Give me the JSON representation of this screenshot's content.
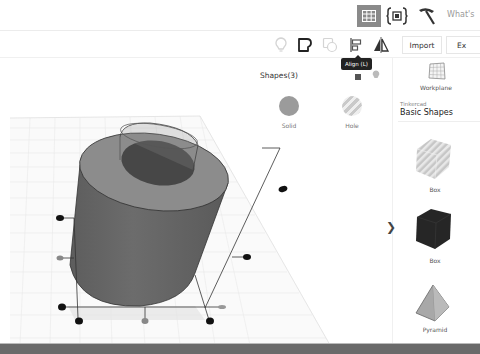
{
  "header": {
    "view_toggle_icon": "grid-icon",
    "codeblocks_icon": "codeblocks-icon",
    "tinker_icon": "pickaxe-icon",
    "whats_new_label": "What's"
  },
  "toolbar": {
    "icons": [
      "lightbulb-icon",
      "notes-icon",
      "ungroup-icon",
      "align-icon",
      "mirror-icon"
    ],
    "import_label": "Import",
    "export_label": "Ex",
    "tooltip": "Align (L)"
  },
  "inspector": {
    "title": "Shapes(3)",
    "solid_label": "Solid",
    "hole_label": "Hole"
  },
  "library": {
    "workplane_label": "Workplane",
    "provider": "Tinkercad",
    "category": "Basic Shapes",
    "shapes": [
      {
        "label": "Box",
        "variant": "hole"
      },
      {
        "label": "Box",
        "variant": "solid"
      },
      {
        "label": "Pyramid",
        "variant": "solid"
      }
    ],
    "collapse_icon": "chevron-right-icon"
  },
  "scene": {
    "objects": [
      "cylinder-solid",
      "cylinder-hole"
    ],
    "handle_count": 12
  }
}
